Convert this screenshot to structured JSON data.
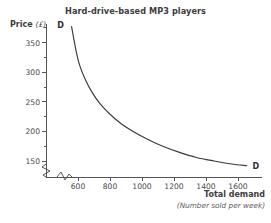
{
  "chart_data": {
    "type": "line",
    "title": "Hard-drive-based MP3 players",
    "xlabel": "Total demand",
    "xsublabel": "(Number sold per week)",
    "ylabel": "Price",
    "yunit": "(£)",
    "xlim": [
      520,
      1760
    ],
    "ylim": [
      120,
      385
    ],
    "xticks": [
      600,
      800,
      1000,
      1200,
      1400,
      1600
    ],
    "yticks": [
      150,
      200,
      250,
      300,
      350
    ],
    "xtick_labels": [
      "600",
      "800",
      "1000",
      "1200",
      "1400",
      "1600"
    ],
    "ytick_labels": [
      "150",
      "200",
      "250",
      "300",
      "350"
    ],
    "minor_yticks": [
      175,
      225,
      275,
      325,
      375
    ],
    "grid": false,
    "legend": "none",
    "axis_break_x": true,
    "axis_break_y": true,
    "series": [
      {
        "name": "D",
        "label_start": "D",
        "label_end": "D",
        "points": [
          {
            "x": 560,
            "y": 377
          },
          {
            "x": 585,
            "y": 340
          },
          {
            "x": 610,
            "y": 312
          },
          {
            "x": 645,
            "y": 288
          },
          {
            "x": 690,
            "y": 265
          },
          {
            "x": 740,
            "y": 246
          },
          {
            "x": 800,
            "y": 229
          },
          {
            "x": 870,
            "y": 213
          },
          {
            "x": 950,
            "y": 199
          },
          {
            "x": 1040,
            "y": 186
          },
          {
            "x": 1130,
            "y": 175
          },
          {
            "x": 1230,
            "y": 165
          },
          {
            "x": 1340,
            "y": 156
          },
          {
            "x": 1450,
            "y": 150
          },
          {
            "x": 1560,
            "y": 145
          },
          {
            "x": 1655,
            "y": 142
          }
        ]
      }
    ]
  },
  "colors": {
    "curve": "#3a3a3a",
    "axis": "#555555",
    "title_text": "#3d3d3d",
    "tick_text": "#4a4a4a",
    "background": "#ffffff"
  }
}
